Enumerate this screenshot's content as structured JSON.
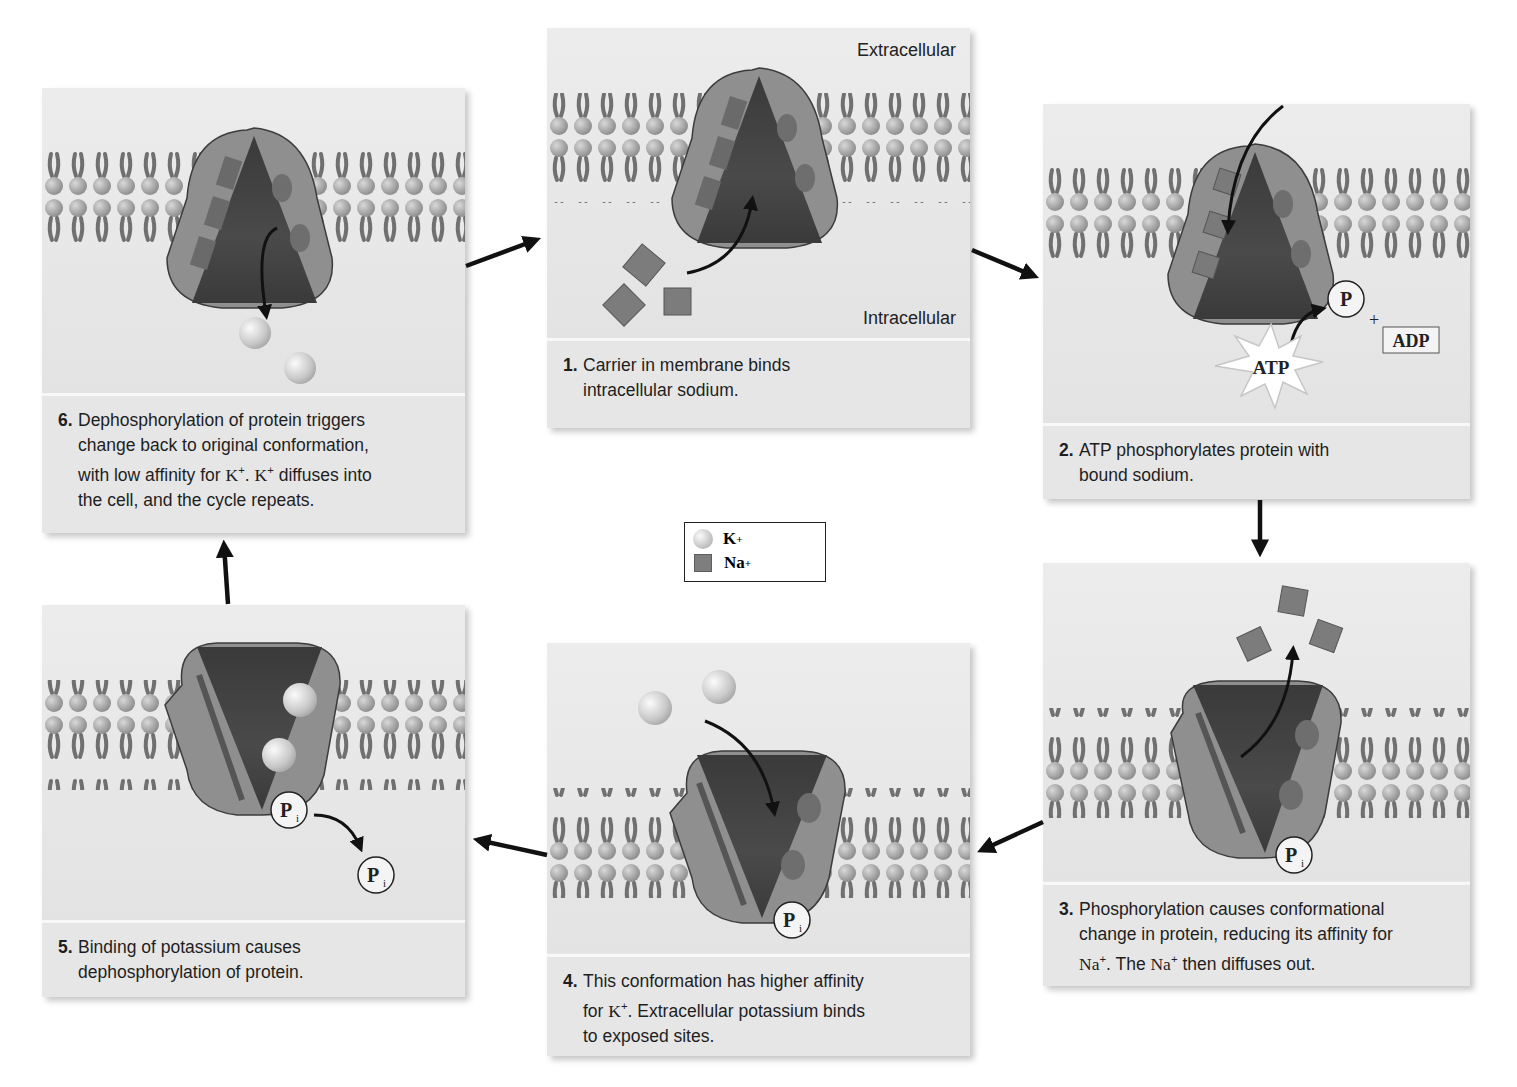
{
  "labels": {
    "extracellular": "Extracellular",
    "intracellular": "Intracellular"
  },
  "legend": {
    "k": "K",
    "k_charge": "+",
    "na": "Na",
    "na_charge": "+"
  },
  "molecule_labels": {
    "phosphate": "P",
    "inorganic_phosphate": "P",
    "inorganic_sub": "i",
    "atp": "ATP",
    "adp": "ADP",
    "plus": "+"
  },
  "steps": [
    {
      "num": "1.",
      "line1": "Carrier in membrane binds",
      "line2": "intracellular sodium."
    },
    {
      "num": "2.",
      "line1": "ATP phosphorylates protein with",
      "line2": "bound sodium."
    },
    {
      "num": "3.",
      "line1": "Phosphorylation causes conformational",
      "line2": "change in protein, reducing its affinity for",
      "na1": "Na",
      "sup": "+",
      "mid": ". The ",
      "na2": "Na",
      "end": " then diffuses out."
    },
    {
      "num": "4.",
      "line1": "This conformation has higher affinity",
      "pre": "for ",
      "k": "K",
      "sup": "+",
      "post": ". Extracellular potassium binds",
      "line3": "to exposed sites."
    },
    {
      "num": "5.",
      "line1": "Binding of potassium causes",
      "line2": "dephosphorylation of protein."
    },
    {
      "num": "6.",
      "line1": "Dephosphorylation of protein triggers",
      "line2": "change back to original conformation,",
      "pre": "with low affinity for ",
      "k": "K",
      "sup": "+",
      "mid": ". ",
      "post": " diffuses into",
      "line4": "the cell, and the cycle repeats."
    }
  ]
}
